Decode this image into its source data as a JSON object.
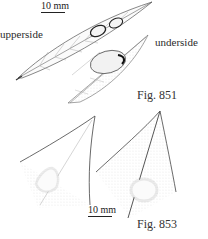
{
  "figures": [
    {
      "id": "fig-851",
      "label": "Fig. 851",
      "scale_bar": "10 mm",
      "views": [
        {
          "label": "upperside"
        },
        {
          "label": "underside"
        }
      ]
    },
    {
      "id": "fig-853",
      "label": "Fig. 853",
      "scale_bar": "10 mm"
    }
  ],
  "colors": {
    "ink": "#2a2a2a",
    "stipple": "#9a9a9a",
    "background": "#ffffff"
  }
}
